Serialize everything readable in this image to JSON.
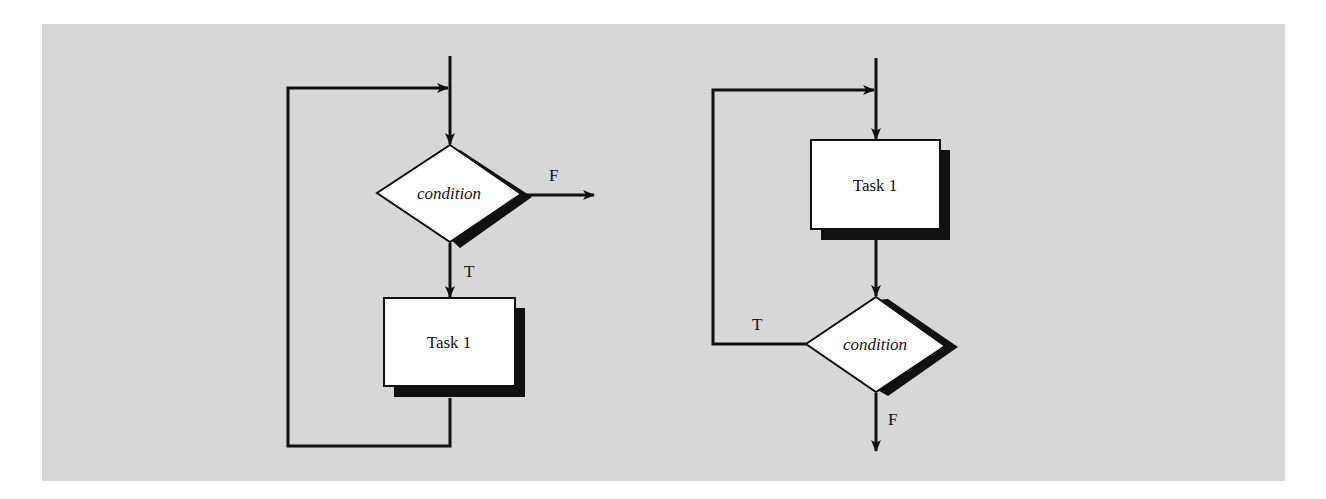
{
  "figure": {
    "background_color": "#d7d7d7",
    "shape_fill": "#ffffff",
    "stroke_color": "#111111",
    "shadow_color": "#111111"
  },
  "while_loop": {
    "decision": {
      "label": "condition"
    },
    "task": {
      "label": "Task 1"
    },
    "true_label": "T",
    "false_label": "F"
  },
  "do_while_loop": {
    "task": {
      "label": "Task 1"
    },
    "decision": {
      "label": "condition"
    },
    "true_label": "T",
    "false_label": "F"
  }
}
